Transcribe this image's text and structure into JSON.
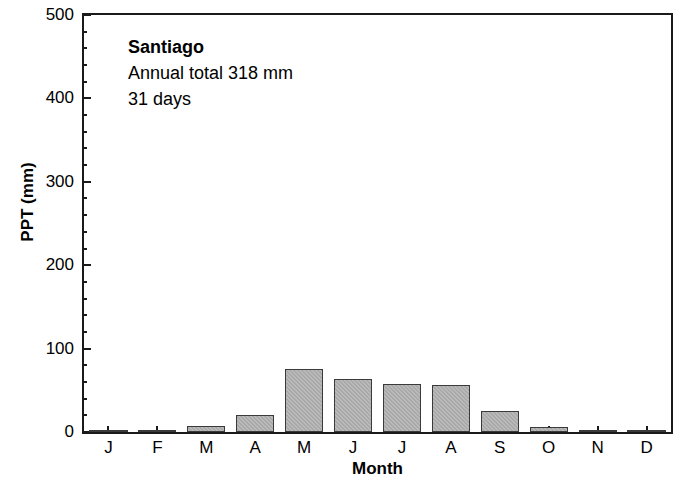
{
  "chart_data": {
    "type": "bar",
    "title": "Santiago",
    "categories": [
      "J",
      "F",
      "M",
      "A",
      "M",
      "J",
      "J",
      "A",
      "S",
      "O",
      "N",
      "D"
    ],
    "category_names": [
      "January",
      "February",
      "March",
      "April",
      "May",
      "June",
      "July",
      "August",
      "September",
      "October",
      "November",
      "December"
    ],
    "values": [
      0,
      0,
      7,
      20,
      75,
      64,
      58,
      56,
      25,
      6,
      1,
      1
    ],
    "xlabel": "Month",
    "ylabel": "PPT (mm)",
    "ylim": [
      0,
      500
    ],
    "y_ticks": [
      0,
      100,
      200,
      300,
      400,
      500
    ],
    "y_tick_labels": [
      "0",
      "100",
      "200",
      "300",
      "400",
      "500"
    ],
    "y_minor_tick_interval": 20,
    "grid": false,
    "legend": "none",
    "bar_color": "#a9a9a9",
    "bar_edge_color": "#3a3a3a",
    "axis_color": "#1a1a1a",
    "background_color": "#ffffff",
    "annotations": [
      "Santiago",
      "Annual total 318 mm",
      "31 days"
    ]
  },
  "annotation": {
    "station_name": "Santiago",
    "annual_total": "Annual total 318 mm",
    "rain_days": "31 days"
  },
  "axes": {
    "x_title": "Month",
    "y_title": "PPT (mm)"
  }
}
